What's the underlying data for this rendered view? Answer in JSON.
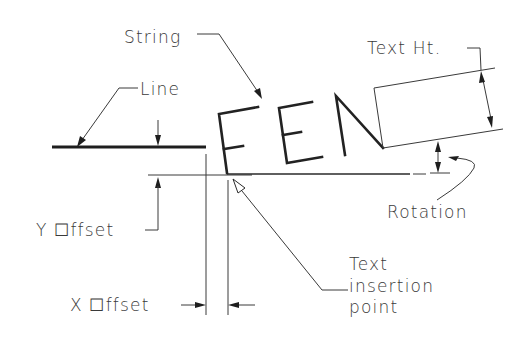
{
  "diagram": {
    "labels": {
      "string": "String",
      "line": "Line",
      "text_ht": "Text Ht.",
      "rotation": "Rotation",
      "y_offset": "Y ☐ffset",
      "x_offset": "X ☐ffset",
      "insertion_1": "Text",
      "insertion_2": "insertion",
      "insertion_3": "point"
    },
    "sample_string": "FEN",
    "colors": {
      "background": "#ffffff",
      "line": "#1e1e1e",
      "text": "#3a3a3a"
    }
  }
}
